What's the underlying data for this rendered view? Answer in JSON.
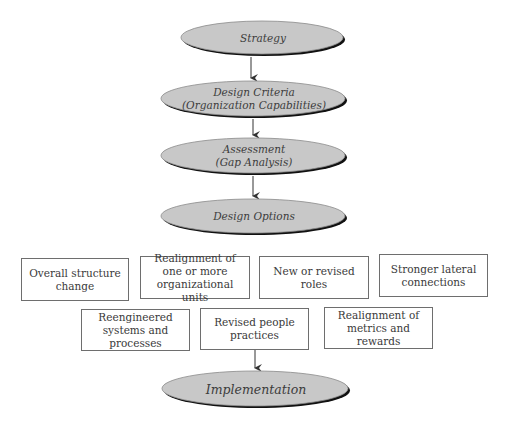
{
  "colors": {
    "ellipse_fill": "#c8c8c8",
    "ellipse_outline": "#8a8a8a",
    "ellipse_shadow": "#111111",
    "box_border": "#6e6e6e",
    "text": "#3a3a3a",
    "arrow": "#333333"
  },
  "flow": {
    "strategy": "Strategy",
    "design_criteria": "Design Criteria\n(Organization Capabilities)",
    "assessment": "Assessment\n(Gap Analysis)",
    "design_options": "Design Options",
    "implementation": "Implementation"
  },
  "options": {
    "row1": [
      "Overall structure\nchange",
      "Realignment of\none or more\norganizational units",
      "New or revised\nroles",
      "Stronger lateral\nconnections"
    ],
    "row2": [
      "Reengineered\nsystems and\nprocesses",
      "Revised people\npractices",
      "Realignment of\nmetrics and\nrewards"
    ]
  }
}
